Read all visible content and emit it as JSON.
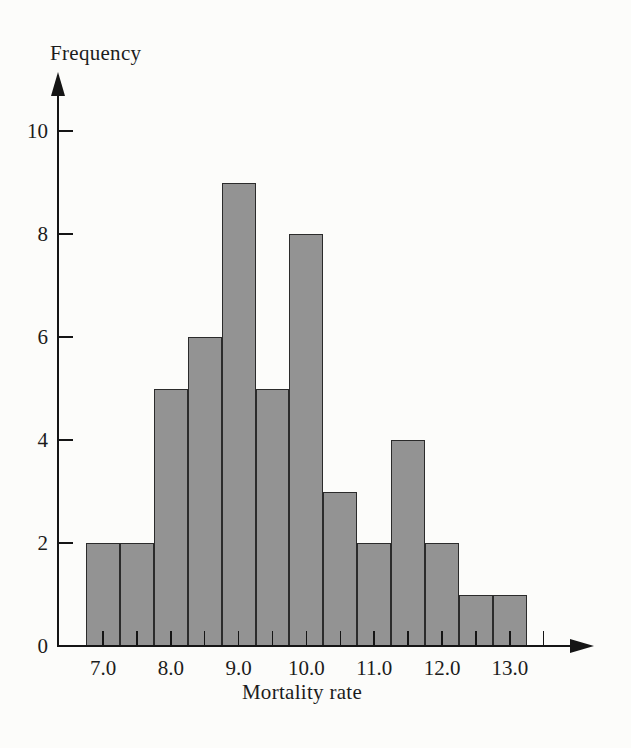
{
  "chart_data": {
    "type": "bar",
    "subtype": "histogram",
    "title": "",
    "xlabel": "Mortality rate",
    "ylabel": "Frequency",
    "categories": [
      7.0,
      7.5,
      8.0,
      8.5,
      9.0,
      9.5,
      10.0,
      10.5,
      11.0,
      11.5,
      12.0,
      12.5,
      13.0
    ],
    "values": [
      2,
      2,
      5,
      6,
      9,
      5,
      8,
      3,
      2,
      4,
      2,
      1,
      1
    ],
    "bin_width": 0.5,
    "yticks": [
      0,
      2,
      4,
      6,
      8,
      10
    ],
    "ytick_labels": [
      "0",
      "2",
      "4",
      "6",
      "8",
      "10"
    ],
    "xtick_label_positions": [
      7,
      8,
      9,
      10,
      11,
      12,
      13
    ],
    "xtick_labels": [
      "7.0",
      "8.0",
      "9.0",
      "10.0",
      "11.0",
      "12.0",
      "13.0"
    ],
    "minor_tick_positions": [
      7.0,
      7.5,
      8.0,
      8.5,
      9.0,
      9.5,
      10.0,
      10.5,
      11.0,
      11.5,
      12.0,
      12.5,
      13.0,
      13.5
    ],
    "xlim": [
      6.3,
      14.2
    ],
    "ylim": [
      0,
      11
    ],
    "grid": false,
    "legend": "none",
    "bar_fill_color": "#939393",
    "bar_border_color": "#2b2b2b",
    "axis_color": "#151515",
    "text_color": "#1c1c1c",
    "background_color": "#fcfcfa"
  }
}
